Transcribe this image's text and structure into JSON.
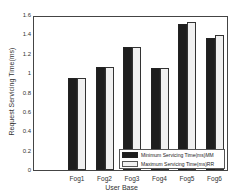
{
  "chart_data": {
    "type": "bar",
    "title": "",
    "xlabel": "User Base",
    "ylabel": "Request Servicing Time(ms)",
    "categories": [
      "Fog1",
      "Fog2",
      "Fog3",
      "Fog4",
      "Fog5",
      "Fog6"
    ],
    "series": [
      {
        "name": "Minimum Servicing Time(ms)MM",
        "color": "#1e1e1e",
        "values": [
          0.96,
          1.07,
          1.28,
          1.06,
          1.52,
          1.37
        ]
      },
      {
        "name": "Maximum Servicing Time(ms)RR",
        "color": "#f0f0f0",
        "values": [
          0.96,
          1.07,
          1.28,
          1.06,
          1.54,
          1.4
        ]
      }
    ],
    "ylim": [
      0,
      1.6
    ],
    "yticks": [
      "0",
      "0.2",
      "0.4",
      "0.6",
      "0.8",
      "1",
      "1.2",
      "1.4",
      "1.6"
    ],
    "grid": false,
    "legend_position": "lower right"
  }
}
